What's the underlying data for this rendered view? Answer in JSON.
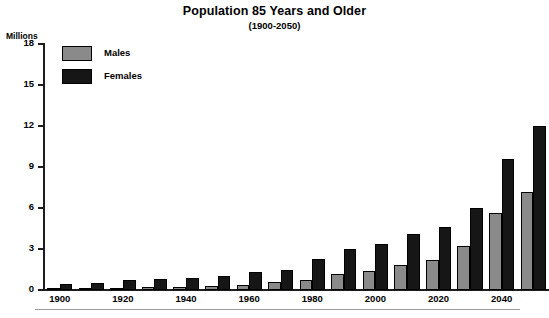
{
  "chart_data": {
    "type": "bar",
    "title": "Population 85 Years and Older",
    "subtitle": "(1900-2050)",
    "xlabel": "",
    "ylabel": "Millions",
    "ylim": [
      0,
      18
    ],
    "yticks": [
      0,
      3,
      6,
      9,
      12,
      15,
      18
    ],
    "ytick_labels": [
      "0",
      "3",
      "6",
      "9",
      "12",
      "15",
      "18"
    ],
    "grid": false,
    "legend_position": "upper-left",
    "categories": [
      "1900",
      "1910",
      "1920",
      "1930",
      "1940",
      "1950",
      "1960",
      "1970",
      "1980",
      "1990",
      "2000",
      "2010",
      "2020",
      "2030",
      "2040",
      "2050"
    ],
    "xtick_labels_shown": [
      "1900",
      "1920",
      "1940",
      "1960",
      "1980",
      "2000",
      "2020",
      "2040"
    ],
    "series": [
      {
        "name": "Males",
        "color": "#8a8a8a",
        "values": [
          0.05,
          0.1,
          0.15,
          0.2,
          0.25,
          0.3,
          0.4,
          0.6,
          0.7,
          1.2,
          1.4,
          1.8,
          2.2,
          3.2,
          5.6,
          7.2
        ]
      },
      {
        "name": "Females",
        "color": "#161616",
        "values": [
          0.45,
          0.5,
          0.7,
          0.8,
          0.9,
          1.0,
          1.3,
          1.5,
          2.3,
          3.0,
          3.4,
          4.1,
          4.6,
          6.0,
          9.6,
          12.0
        ]
      }
    ]
  },
  "legend": {
    "males_label": "Males",
    "females_label": "Females"
  }
}
